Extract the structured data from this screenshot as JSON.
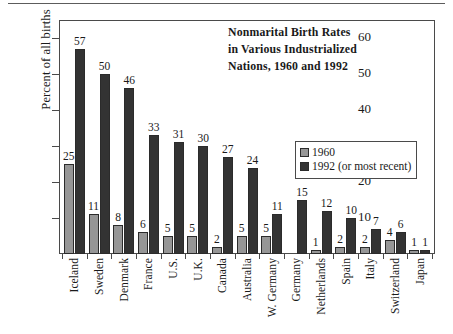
{
  "chart_data": {
    "type": "bar",
    "title_lines": [
      "Nonmarital Birth Rates",
      "in Various Industrialized",
      "Nations, 1960 and 1992"
    ],
    "xlabel": "",
    "ylabel": "Percent of all births",
    "ylim": [
      0,
      65
    ],
    "yticks": [
      10,
      20,
      30,
      40,
      50,
      60
    ],
    "grid": false,
    "legend_position": "inside-right",
    "categories": [
      "Iceland",
      "Sweden",
      "Denmark",
      "France",
      "U.S.",
      "U.K.",
      "Canada",
      "Australia",
      "W. Germany",
      "Germany",
      "Netherlands",
      "Spain",
      "Italy",
      "Switzerland",
      "Japan"
    ],
    "series": [
      {
        "name": "1960",
        "color": "#969696",
        "values": [
          25,
          11,
          8,
          6,
          5,
          5,
          2,
          5,
          5,
          null,
          1,
          2,
          2,
          4,
          1
        ]
      },
      {
        "name": "1992 (or most recent)",
        "color": "#333333",
        "values": [
          57,
          50,
          46,
          33,
          31,
          30,
          27,
          24,
          11,
          15,
          12,
          10,
          7,
          6,
          1
        ]
      }
    ]
  },
  "legend": {
    "entries": [
      {
        "label": "1960",
        "swatch": "s1960"
      },
      {
        "label": "1992 (or most recent)",
        "swatch": "s1992"
      }
    ]
  }
}
